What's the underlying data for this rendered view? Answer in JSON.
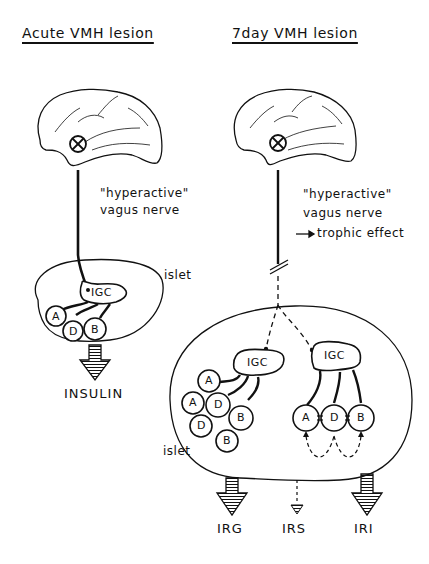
{
  "panels": {
    "left": {
      "title": "Acute VMH lesion",
      "nerve_label_1": "\"hyperactive\"",
      "nerve_label_2": "vagus nerve",
      "islet_label": "islet",
      "igc_label": "IGC",
      "cells": [
        "A",
        "D",
        "B"
      ],
      "output_label": "INSULIN"
    },
    "right": {
      "title": "7day  VMH lesion",
      "nerve_label_1": "\"hyperactive\"",
      "nerve_label_2": "vagus nerve",
      "trophic_label": "trophic effect",
      "islet_label": "islet",
      "igc_label_left": "IGC",
      "igc_label_right": "IGC",
      "cluster_cells": [
        "A",
        "A",
        "D",
        "D",
        "B",
        "B"
      ],
      "row_cells": [
        "A",
        "D",
        "B"
      ],
      "outputs": [
        "IRG",
        "IRS",
        "IRI"
      ]
    }
  },
  "icons": {
    "lesion": "circled-x",
    "brain": "brain-outline",
    "secretion": "hatched-down-arrow"
  }
}
